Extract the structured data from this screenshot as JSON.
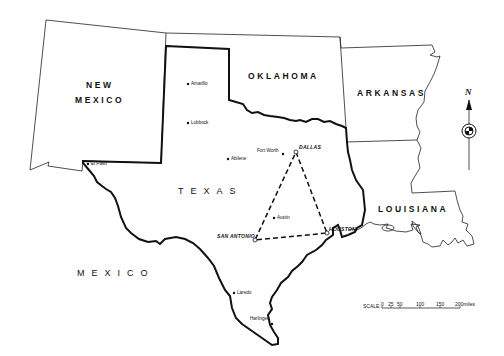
{
  "map": {
    "states": [
      {
        "id": "new-mexico",
        "label_line1": "NEW",
        "label_line2": "MEXICO"
      },
      {
        "id": "oklahoma",
        "label": "OKLAHOMA"
      },
      {
        "id": "arkansas",
        "label": "ARKANSAS"
      },
      {
        "id": "texas",
        "label": "TEXAS"
      },
      {
        "id": "louisiana",
        "label": "LOUISIANA"
      }
    ],
    "country": {
      "label": "MEXICO"
    },
    "cities": [
      {
        "name": "Amarillo"
      },
      {
        "name": "Lubbock"
      },
      {
        "name": "Abilene"
      },
      {
        "name": "Fort Worth"
      },
      {
        "name": "El Paso"
      },
      {
        "name": "Austin"
      },
      {
        "name": "Laredo"
      },
      {
        "name": "Harlingen"
      }
    ],
    "triangle_cities": [
      {
        "name": "DALLAS"
      },
      {
        "name": "SAN ANTONIO"
      },
      {
        "name": "HOUSTON"
      }
    ],
    "compass": {
      "label": "N"
    },
    "scale": {
      "label": "SCALE:",
      "ticks": [
        "0",
        "25",
        "50",
        "100",
        "150",
        "200miles"
      ]
    },
    "colors": {
      "ink": "#111111",
      "background": "#ffffff"
    }
  }
}
